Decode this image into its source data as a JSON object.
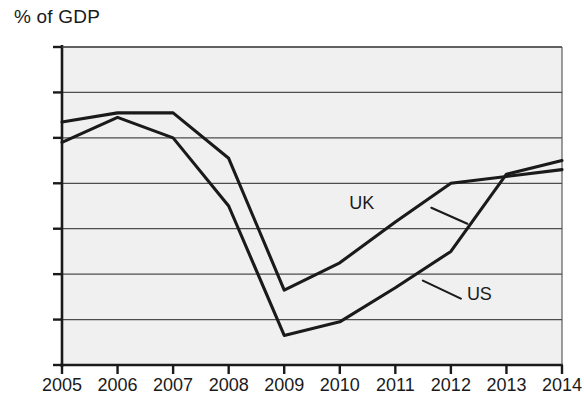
{
  "chart_data": {
    "type": "line",
    "title": "% of GDP",
    "xlabel": "",
    "ylabel": "% of GDP",
    "categories": [
      2005,
      2006,
      2007,
      2008,
      2009,
      2010,
      2011,
      2012,
      2013,
      2014
    ],
    "xtick_labels": [
      "2005",
      "2006",
      "2007",
      "2008",
      "2009",
      "2010",
      "2011",
      "2012",
      "2013",
      "2014"
    ],
    "ytick_labels": [
      "0",
      "-2",
      "-4",
      "-6",
      "-8",
      "-10",
      "-12",
      "-14"
    ],
    "ytick_values": [
      0,
      -2,
      -4,
      -6,
      -8,
      -10,
      -12,
      -14
    ],
    "ylim": [
      -14,
      0
    ],
    "xlim": [
      2005,
      2014
    ],
    "grid": true,
    "grid_axis": "y",
    "legend": "inline-annotations",
    "series": [
      {
        "name": "UK",
        "values": [
          -3.3,
          -2.9,
          -2.9,
          -4.9,
          -10.7,
          -9.5,
          -7.7,
          -6.0,
          -5.7,
          -5.4
        ],
        "color": "#1a1a1a"
      },
      {
        "name": "US",
        "values": [
          -4.2,
          -3.1,
          -4.0,
          -7.0,
          -12.7,
          -12.1,
          -10.6,
          -9.0,
          -5.6,
          -5.0
        ],
        "color": "#1a1a1a"
      }
    ],
    "annotations": [
      {
        "text": "UK",
        "x": 2011,
        "y": -6.9
      },
      {
        "text": "US",
        "x": 2012,
        "y": -10.9
      }
    ]
  },
  "colors": {
    "plot_background": "#f0f0f0",
    "grid": "#4d4d4d",
    "axis": "#1a1a1a",
    "line": "#1a1a1a",
    "text": "#1a1a1a"
  }
}
